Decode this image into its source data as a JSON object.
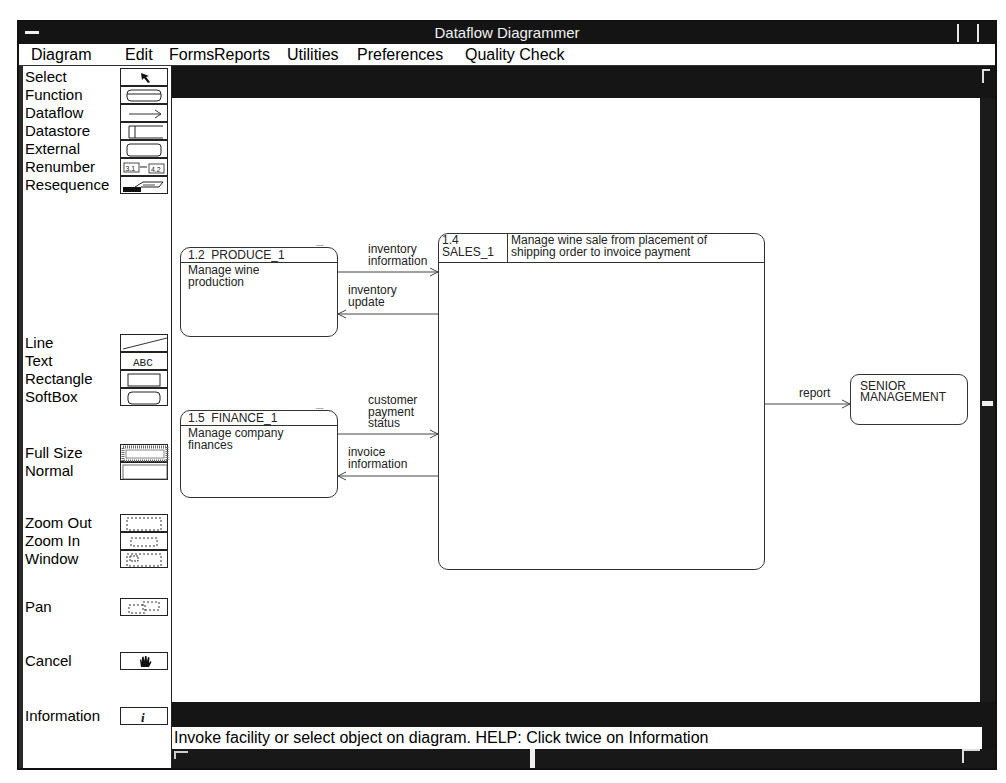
{
  "window": {
    "title": "Dataflow Diagrammer"
  },
  "menu": [
    {
      "label": "Diagram"
    },
    {
      "label": "Edit"
    },
    {
      "label": "Forms"
    },
    {
      "label": "Reports"
    },
    {
      "label": "Utilities"
    },
    {
      "label": "Preferences"
    },
    {
      "label": "Quality Check"
    }
  ],
  "palette": {
    "tools": [
      {
        "label": "Select",
        "icon": "arrow-pointer-icon"
      },
      {
        "label": "Function",
        "icon": "rounded-box-icon"
      },
      {
        "label": "Dataflow",
        "icon": "right-arrow-icon"
      },
      {
        "label": "Datastore",
        "icon": "open-box-icon"
      },
      {
        "label": "External",
        "icon": "rounded-rect-icon"
      },
      {
        "label": "Renumber",
        "icon": "renumber-icon",
        "icon_text_a": "3.1",
        "icon_text_b": "4.2"
      },
      {
        "label": "Resequence",
        "icon": "resequence-icon"
      },
      {
        "label": "Line",
        "icon": "diagonal-line-icon"
      },
      {
        "label": "Text",
        "icon": "abc-text-icon",
        "icon_text": "ABC"
      },
      {
        "label": "Rectangle",
        "icon": "rectangle-icon"
      },
      {
        "label": "SoftBox",
        "icon": "softbox-icon"
      },
      {
        "label": "Full Size",
        "icon": "full-size-icon"
      },
      {
        "label": "Normal",
        "icon": "normal-size-icon"
      },
      {
        "label": "Zoom Out",
        "icon": "zoom-out-icon"
      },
      {
        "label": "Zoom In",
        "icon": "zoom-in-icon"
      },
      {
        "label": "Window",
        "icon": "zoom-window-icon"
      },
      {
        "label": "Pan",
        "icon": "pan-icon"
      },
      {
        "label": "Cancel",
        "icon": "hand-stop-icon"
      },
      {
        "label": "Information",
        "icon": "info-icon",
        "icon_text": "i"
      }
    ]
  },
  "diagram": {
    "processes": [
      {
        "id": "1.2",
        "name": "PRODUCE_1",
        "description_lines": [
          "Manage wine",
          "production"
        ]
      },
      {
        "id": "1.5",
        "name": "FINANCE_1",
        "description_lines": [
          "Manage company",
          "finances"
        ]
      },
      {
        "id": "1.4",
        "name": "SALES_1",
        "description_lines": [
          "Manage wine sale from placement of",
          "shipping order to invoice payment"
        ]
      }
    ],
    "externals": [
      {
        "name_lines": [
          "SENIOR",
          "MANAGEMENT"
        ]
      }
    ],
    "flows": [
      {
        "from": "PRODUCE_1",
        "to": "SALES_1",
        "label_lines": [
          "inventory",
          "information"
        ]
      },
      {
        "from": "SALES_1",
        "to": "PRODUCE_1",
        "label_lines": [
          "inventory",
          "update"
        ]
      },
      {
        "from": "FINANCE_1",
        "to": "SALES_1",
        "label_lines": [
          "customer",
          "payment",
          "status"
        ]
      },
      {
        "from": "SALES_1",
        "to": "FINANCE_1",
        "label_lines": [
          "invoice",
          "information"
        ]
      },
      {
        "from": "SALES_1",
        "to": "SENIOR MANAGEMENT",
        "label_lines": [
          "report"
        ]
      }
    ]
  },
  "status": {
    "message": "Invoke facility or select object on diagram. HELP: Click twice on Information"
  }
}
